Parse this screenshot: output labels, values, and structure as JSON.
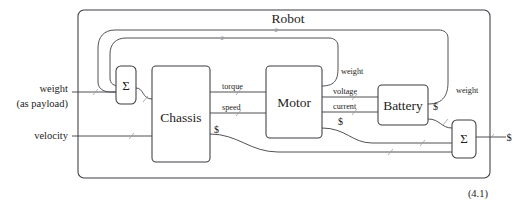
{
  "figure": {
    "title": "Robot",
    "equation_number": "(4.1)"
  },
  "blocks": [
    {
      "id": "chassis",
      "label": "Chassis"
    },
    {
      "id": "motor",
      "label": "Motor"
    },
    {
      "id": "battery",
      "label": "Battery"
    },
    {
      "id": "sum_left",
      "label": "Σ"
    },
    {
      "id": "sum_right",
      "label": "Σ"
    }
  ],
  "external_inputs": [
    {
      "id": "weight_payload",
      "line1": "weight",
      "line2": "(as payload)"
    },
    {
      "id": "velocity",
      "line1": "velocity",
      "line2": ""
    }
  ],
  "external_outputs": [
    {
      "id": "money_out",
      "label": "$"
    }
  ],
  "port_labels": {
    "torque": "torque",
    "speed": "speed",
    "voltage": "voltage",
    "current": "current",
    "weight_motor": "weight",
    "weight_battery": "weight",
    "money_chassis": "$",
    "money_motor": "$",
    "money_battery": "$"
  },
  "wire_markers": {
    "loop_outer": "2",
    "loop_inner": "2"
  },
  "colors": {
    "stroke": "#3d3d44",
    "text": "#1d1d22",
    "marker": "#8a8a92",
    "background": "#ffffff"
  }
}
